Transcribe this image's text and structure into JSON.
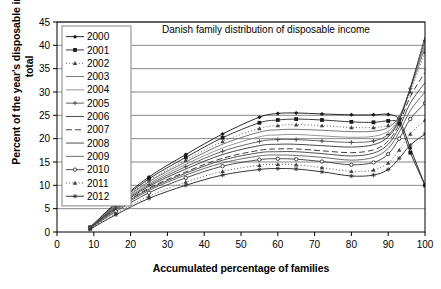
{
  "chart_data": {
    "type": "line",
    "title": "Danish family distribution of disposable income",
    "xlabel": "Accumulated percentage of families",
    "ylabel": "Percent of the year's disposable income total",
    "xlim": [
      0,
      100
    ],
    "ylim": [
      0,
      45
    ],
    "xticks": [
      0,
      10,
      20,
      30,
      40,
      50,
      60,
      70,
      80,
      90,
      100
    ],
    "yticks": [
      0,
      5,
      10,
      15,
      20,
      25,
      30,
      35,
      40,
      45
    ],
    "grid": "horizontal",
    "legend_position": "top-left-inside",
    "x": [
      9,
      16,
      25,
      35,
      45,
      55,
      60,
      65,
      72,
      80,
      86,
      90,
      93,
      96,
      100
    ],
    "series": [
      {
        "name": "2000",
        "marker": "diamond",
        "dash": "solid",
        "values": [
          1.0,
          6.2,
          11.8,
          16.6,
          21.0,
          24.6,
          25.4,
          25.5,
          25.3,
          25.1,
          25.1,
          25.2,
          24.0,
          18.0,
          10.0
        ]
      },
      {
        "name": "2001",
        "marker": "square",
        "dash": "solid",
        "values": [
          1.0,
          6.0,
          11.4,
          16.0,
          20.2,
          23.4,
          24.0,
          24.2,
          24.0,
          23.6,
          23.5,
          23.8,
          23.2,
          17.0,
          10.0
        ]
      },
      {
        "name": "2002",
        "marker": "triangle",
        "dash": "dotted",
        "values": [
          1.0,
          5.8,
          11.0,
          15.4,
          19.4,
          22.2,
          22.8,
          23.0,
          22.8,
          22.4,
          22.4,
          22.9,
          24.6,
          30.0,
          38.5
        ]
      },
      {
        "name": "2003",
        "marker": "none",
        "dash": "solid",
        "values": [
          1.0,
          5.7,
          10.8,
          15.0,
          18.8,
          21.4,
          21.9,
          22.0,
          21.8,
          21.5,
          21.6,
          22.4,
          24.8,
          30.6,
          39.5
        ]
      },
      {
        "name": "2004",
        "marker": "none",
        "dash": "solid",
        "values": [
          1.0,
          5.5,
          10.4,
          14.5,
          18.0,
          20.4,
          20.8,
          20.9,
          20.6,
          20.3,
          20.5,
          21.6,
          24.5,
          30.8,
          40.2
        ]
      },
      {
        "name": "2005",
        "marker": "plus",
        "dash": "solid",
        "values": [
          1.0,
          5.4,
          10.1,
          14.0,
          17.3,
          19.4,
          19.8,
          19.8,
          19.5,
          19.2,
          19.5,
          20.9,
          24.2,
          30.8,
          41.0
        ]
      },
      {
        "name": "2006",
        "marker": "none",
        "dash": "solid",
        "values": [
          1.0,
          5.2,
          9.8,
          13.5,
          16.6,
          18.5,
          18.8,
          18.8,
          18.5,
          18.2,
          18.7,
          20.4,
          24.0,
          30.9,
          41.8
        ]
      },
      {
        "name": "2007",
        "marker": "none",
        "dash": "dashed",
        "values": [
          0.9,
          5.0,
          9.4,
          12.9,
          15.8,
          17.5,
          17.8,
          17.8,
          17.4,
          17.0,
          17.6,
          19.5,
          23.2,
          29.0,
          34.2
        ]
      },
      {
        "name": "2008",
        "marker": "none",
        "dash": "solid",
        "values": [
          0.9,
          4.9,
          9.2,
          12.6,
          15.4,
          17.0,
          17.2,
          17.2,
          16.8,
          16.3,
          16.9,
          18.8,
          22.4,
          27.6,
          32.0
        ]
      },
      {
        "name": "2009",
        "marker": "none",
        "dash": "solid",
        "values": [
          0.9,
          4.7,
          8.9,
          12.2,
          14.8,
          16.3,
          16.5,
          16.4,
          16.0,
          15.4,
          16.0,
          17.9,
          21.4,
          26.0,
          30.0
        ]
      },
      {
        "name": "2010",
        "marker": "circle",
        "dash": "solid",
        "values": [
          0.8,
          4.4,
          8.4,
          11.6,
          14.1,
          15.5,
          15.7,
          15.6,
          15.1,
          14.4,
          14.9,
          16.7,
          20.0,
          24.2,
          27.6
        ]
      },
      {
        "name": "2011",
        "marker": "triangle",
        "dash": "dotted",
        "values": [
          0.7,
          4.0,
          7.7,
          10.7,
          13.0,
          14.3,
          14.5,
          14.4,
          13.8,
          13.0,
          13.3,
          14.8,
          17.6,
          21.0,
          24.0
        ]
      },
      {
        "name": "2012",
        "marker": "star",
        "dash": "solid",
        "values": [
          0.6,
          3.7,
          7.2,
          10.0,
          12.2,
          13.4,
          13.6,
          13.5,
          12.9,
          12.0,
          12.2,
          13.4,
          15.8,
          18.6,
          21.0
        ]
      }
    ]
  }
}
